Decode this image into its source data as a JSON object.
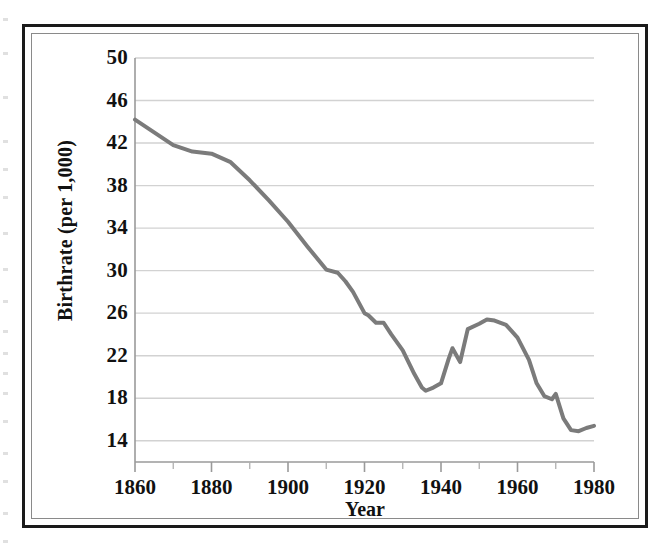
{
  "figure": {
    "border_color": "#1a1a1a",
    "inner_border_color": "#8a8a8a",
    "background": "#ffffff"
  },
  "chart_data": {
    "type": "line",
    "title": "",
    "subtitle": "",
    "xlabel": "Year",
    "ylabel": "Birthrate (per 1,000)",
    "xlim": [
      1860,
      1980
    ],
    "ylim": [
      12,
      50
    ],
    "grid": true,
    "grid_axis": "y",
    "grid_color": "#d2d2d2",
    "legend": false,
    "legend_position": "none",
    "line_color": "#7b7b7b",
    "line_width": 4,
    "x_ticks_major": [
      1860,
      1880,
      1900,
      1920,
      1940,
      1960,
      1980
    ],
    "x_tick_labels": [
      "1860",
      "1880",
      "1900",
      "1920",
      "1940",
      "1960",
      "1980"
    ],
    "x_ticks_minor": [
      1870,
      1890,
      1910,
      1930,
      1950,
      1970
    ],
    "y_ticks": [
      14,
      18,
      22,
      26,
      30,
      34,
      38,
      42,
      46,
      50
    ],
    "y_tick_labels": [
      "14",
      "18",
      "22",
      "26",
      "30",
      "34",
      "38",
      "42",
      "46",
      "50"
    ],
    "series": [
      {
        "name": "Birthrate",
        "x": [
          1860,
          1865,
          1870,
          1875,
          1880,
          1885,
          1890,
          1895,
          1900,
          1905,
          1910,
          1913,
          1915,
          1917,
          1920,
          1921,
          1923,
          1925,
          1927,
          1930,
          1933,
          1935,
          1936,
          1938,
          1940,
          1942,
          1943,
          1945,
          1947,
          1950,
          1952,
          1954,
          1957,
          1960,
          1963,
          1965,
          1967,
          1969,
          1970,
          1972,
          1974,
          1976,
          1978,
          1980
        ],
        "y": [
          44.2,
          43.0,
          41.8,
          41.2,
          41.0,
          40.2,
          38.5,
          36.6,
          34.6,
          32.3,
          30.1,
          29.8,
          29.0,
          28.0,
          26.0,
          25.8,
          25.1,
          25.1,
          24.0,
          22.5,
          20.3,
          19.0,
          18.7,
          19.0,
          19.4,
          21.7,
          22.7,
          21.4,
          24.5,
          25.0,
          25.4,
          25.3,
          24.9,
          23.7,
          21.6,
          19.4,
          18.2,
          17.9,
          18.4,
          16.1,
          15.0,
          14.9,
          15.2,
          15.4
        ]
      }
    ]
  },
  "axis_titles": {
    "y": "Birthrate (per 1,000)",
    "x": "Year"
  }
}
